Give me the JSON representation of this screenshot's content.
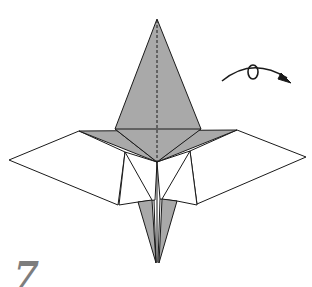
{
  "diagram": {
    "type": "origami-step",
    "step_number": "7",
    "symbols": [
      {
        "name": "turn-over-arrow",
        "meaning": "turn the model over"
      }
    ],
    "lines": [
      {
        "kind": "valley-fold-dashed",
        "location": "vertical center line from top point to center"
      }
    ],
    "colors": {
      "paper_colored": "#a9a9a9",
      "paper_white": "#ffffff",
      "outline": "#1a1a1a",
      "step_number": "#7d7d7d"
    }
  }
}
